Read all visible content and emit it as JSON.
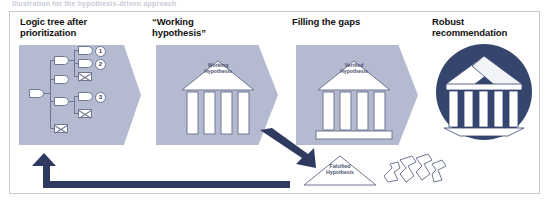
{
  "caption": {
    "text": "Illustration for the hypothesis-driven approach"
  },
  "colors": {
    "panel_fill": "#b4bad0",
    "navy_arrow": "#2e3a60",
    "circle_navy": "#35456e",
    "outline": "#6f7792",
    "frame_border": "#c9c9c9",
    "white": "#ffffff"
  },
  "headers": [
    {
      "label": "Logic tree after\nprioritization",
      "name": "header-logic-tree"
    },
    {
      "label": "“Working\nhypothesis”",
      "name": "header-working-hypothesis"
    },
    {
      "label": "Filling the gaps",
      "name": "header-filling-the-gaps"
    },
    {
      "label": "Robust\nrecommendation",
      "name": "header-robust-recommendation"
    }
  ],
  "panels": [
    {
      "id": "panel-logic-tree",
      "shape": "chevron",
      "content": "logic-tree",
      "tree": {
        "root": {
          "label": ""
        },
        "branches": [
          {
            "label": "",
            "children": [
              {
                "label": "",
                "priority": "1",
                "status": "open"
              },
              {
                "label": "",
                "priority": "2",
                "status": "open"
              },
              {
                "label": "",
                "priority": "",
                "status": "eliminated"
              }
            ]
          },
          {
            "label": "",
            "children": []
          },
          {
            "label": "",
            "children": [
              {
                "label": "",
                "priority": "3",
                "status": "open"
              },
              {
                "label": "",
                "priority": "",
                "status": "eliminated"
              }
            ]
          },
          {
            "label": "",
            "status": "eliminated",
            "children": []
          }
        ],
        "priority_markers": [
          "1",
          "2",
          "3"
        ],
        "legend": {
          "open": "open branch",
          "eliminated": "eliminated branch (crossed out)"
        }
      }
    },
    {
      "id": "panel-working-hypothesis",
      "shape": "chevron",
      "content": "temple",
      "temple": {
        "pediment_label": "Working\nHypothesis",
        "columns": 4,
        "has_plinth": false
      }
    },
    {
      "id": "panel-filling-the-gaps",
      "shape": "chevron",
      "content": "temple",
      "temple": {
        "pediment_label": "Verified\nHypothesis",
        "columns": 4,
        "has_plinth": true
      }
    },
    {
      "id": "panel-robust-recommendation",
      "shape": "circle",
      "content": "temple-3d",
      "temple": {
        "pediment_label": "",
        "columns": 5,
        "has_plinth": true
      }
    }
  ],
  "falsified": {
    "pediment_label": "Falsified\nHypothesis",
    "collapsed_columns": 4,
    "name": "falsified-hypothesis"
  },
  "arrows": [
    {
      "name": "arrow-working-to-verified",
      "direction": "down-right",
      "style": "solid-navy"
    },
    {
      "name": "arrow-feedback-loop",
      "direction": "left-then-up",
      "style": "solid-navy"
    }
  ]
}
